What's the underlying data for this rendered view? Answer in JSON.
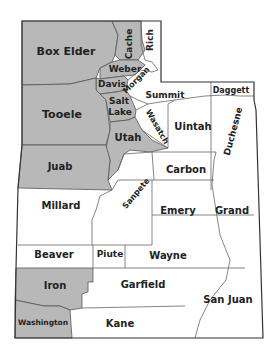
{
  "map": {
    "title": "Utah counties",
    "colors": {
      "highlight": "#b8b8b8",
      "normal": "#ffffff",
      "border": "#555555",
      "text": "#222222"
    },
    "counties": [
      {
        "name": "Box Elder",
        "highlighted": true
      },
      {
        "name": "Cache",
        "highlighted": true
      },
      {
        "name": "Rich",
        "highlighted": false
      },
      {
        "name": "Weber",
        "highlighted": true
      },
      {
        "name": "Davis",
        "highlighted": true
      },
      {
        "name": "Morgan",
        "highlighted": false
      },
      {
        "name": "Tooele",
        "highlighted": true
      },
      {
        "name": "Salt Lake",
        "highlighted": true
      },
      {
        "name": "Summit",
        "highlighted": false
      },
      {
        "name": "Daggett",
        "highlighted": false
      },
      {
        "name": "Utah",
        "highlighted": true
      },
      {
        "name": "Wasatch",
        "highlighted": false
      },
      {
        "name": "Uintah",
        "highlighted": false
      },
      {
        "name": "Duchesne",
        "highlighted": false
      },
      {
        "name": "Juab",
        "highlighted": true
      },
      {
        "name": "Carbon",
        "highlighted": false
      },
      {
        "name": "Sanpete",
        "highlighted": false
      },
      {
        "name": "Millard",
        "highlighted": false
      },
      {
        "name": "Emery",
        "highlighted": false
      },
      {
        "name": "Grand",
        "highlighted": false
      },
      {
        "name": "Beaver",
        "highlighted": false
      },
      {
        "name": "Piute",
        "highlighted": false
      },
      {
        "name": "Wayne",
        "highlighted": false
      },
      {
        "name": "Iron",
        "highlighted": true
      },
      {
        "name": "Garfield",
        "highlighted": false
      },
      {
        "name": "San Juan",
        "highlighted": false
      },
      {
        "name": "Washington",
        "highlighted": true
      },
      {
        "name": "Kane",
        "highlighted": false
      }
    ],
    "labels": {
      "box_elder": "Box Elder",
      "cache": "Cache",
      "rich": "Rich",
      "weber": "Weber",
      "davis": "Davis",
      "morgan": "Morgan",
      "tooele": "Tooele",
      "salt_lake_1": "Salt",
      "salt_lake_2": "Lake",
      "summit": "Summit",
      "daggett": "Daggett",
      "utah": "Utah",
      "wasatch": "Wasatch",
      "uintah": "Uintah",
      "duchesne": "Duchesne",
      "juab": "Juab",
      "carbon": "Carbon",
      "sanpete": "Sanpete",
      "millard": "Millard",
      "emery": "Emery",
      "grand": "Grand",
      "beaver": "Beaver",
      "piute": "Piute",
      "wayne": "Wayne",
      "iron": "Iron",
      "garfield": "Garfield",
      "san_juan": "San Juan",
      "washington": "Washington",
      "kane": "Kane"
    }
  }
}
